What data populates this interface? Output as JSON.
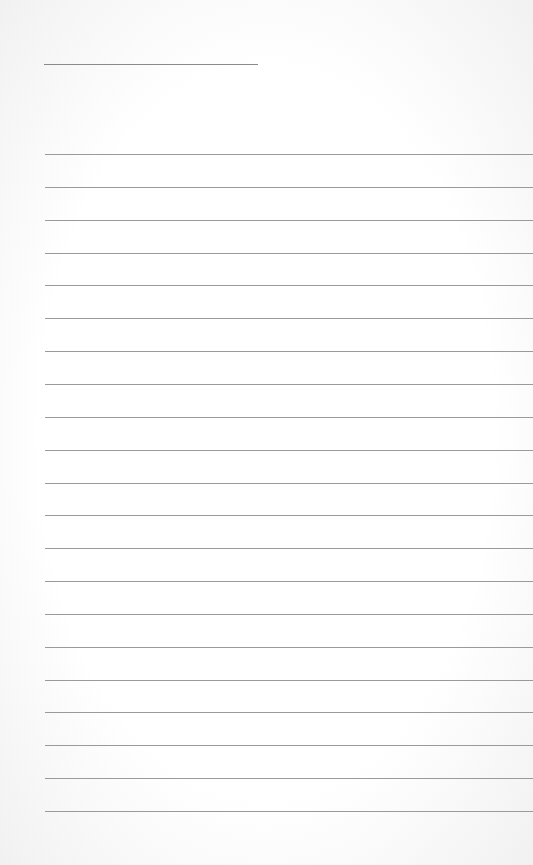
{
  "page": {
    "type": "lined-notepaper",
    "background_color": "#ffffff",
    "line_color": "#9a9a9a",
    "title_line": {
      "present": true
    },
    "ruled_lines": {
      "count": 21,
      "first_y": 154,
      "spacing": 32.85
    }
  }
}
